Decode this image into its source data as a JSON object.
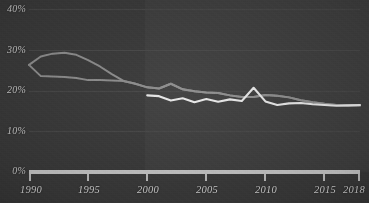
{
  "chart_data": {
    "type": "line",
    "title": "",
    "subtitle": "",
    "xlabel": "",
    "ylabel": "",
    "xlim": [
      1990,
      2018
    ],
    "ylim": [
      0,
      40
    ],
    "grid": true,
    "legend_position": "none",
    "ytick_labels": [
      "40%",
      "30%",
      "20%",
      "10%",
      "0%"
    ],
    "ytick_values": [
      40,
      30,
      20,
      10,
      0
    ],
    "xtick_labels": [
      "1990",
      "1995",
      "2000",
      "2005",
      "2010",
      "2015",
      "2018"
    ],
    "xtick_values": [
      1990,
      1995,
      2000,
      2005,
      2010,
      2015,
      2018
    ],
    "colors": {
      "background": "#3a3a3a",
      "panel_highlight": "#414141",
      "axis": "#c8c8c8",
      "grid": "#474747",
      "tick_text": "#d2d2d2",
      "series_upper": "#8e8e8e",
      "series_lower": "#8e8e8e",
      "series_highlight": "#e8e8e8"
    },
    "series": [
      {
        "name": "upper-bound",
        "color": "#8e8e8e",
        "x": [
          1990,
          1991,
          1992,
          1993,
          1994,
          1995,
          1996,
          1997,
          1998,
          1999,
          2000,
          2001,
          2002,
          2003,
          2004,
          2005,
          2006,
          2007,
          2008,
          2009,
          2010,
          2011,
          2012,
          2013,
          2014,
          2015,
          2016,
          2017,
          2018
        ],
        "values": [
          26.2,
          28.3,
          29.0,
          29.2,
          28.7,
          27.4,
          25.8,
          23.9,
          22.2,
          21.5,
          20.6,
          20.3,
          21.5,
          20.1,
          19.6,
          19.3,
          19.2,
          18.6,
          18.2,
          18.2,
          18.7,
          18.5,
          18.1,
          17.4,
          16.9,
          16.5,
          16.2,
          16.1,
          16.1
        ]
      },
      {
        "name": "lower-bound",
        "color": "#8e8e8e",
        "x": [
          1990,
          1991,
          1992,
          1993,
          1994,
          1995,
          1996,
          1997,
          1998,
          1999,
          2000,
          2001,
          2002,
          2003,
          2004,
          2005,
          2006,
          2007,
          2008,
          2009,
          2010,
          2011,
          2012,
          2013,
          2014,
          2015,
          2016,
          2017,
          2018
        ],
        "values": [
          26.2,
          23.4,
          23.3,
          23.2,
          22.9,
          22.4,
          22.4,
          22.3,
          22.2,
          21.5,
          20.6,
          20.3,
          21.5,
          20.1,
          19.6,
          19.3,
          19.2,
          18.6,
          18.2,
          18.2,
          18.7,
          18.5,
          18.1,
          17.4,
          16.9,
          16.5,
          16.2,
          16.1,
          16.1
        ]
      },
      {
        "name": "highlight-series",
        "color": "#e8e8e8",
        "x": [
          2000,
          2001,
          2002,
          2003,
          2004,
          2005,
          2006,
          2007,
          2008,
          2009,
          2010,
          2011,
          2012,
          2013,
          2014,
          2015,
          2016,
          2017,
          2018
        ],
        "values": [
          18.6,
          18.4,
          17.3,
          17.9,
          16.9,
          17.7,
          17.0,
          17.6,
          17.2,
          20.5,
          17.1,
          16.2,
          16.6,
          16.7,
          16.4,
          16.2,
          16.0,
          16.1,
          16.2
        ]
      }
    ]
  },
  "axes": {
    "baseline_label": "0%"
  }
}
